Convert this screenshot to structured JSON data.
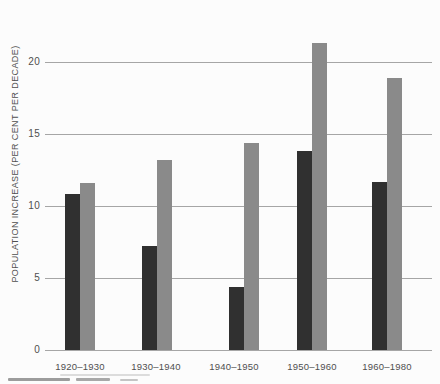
{
  "chart_data": {
    "type": "bar",
    "title": "",
    "ylabel": "POPULATION INCREASE (PER CENT PER DECADE)",
    "xlabel": "",
    "categories": [
      "1920–1930",
      "1930–1940",
      "1940–1950",
      "1950–1960",
      "1960–1980"
    ],
    "series": [
      {
        "name": "dark",
        "color": "#303030",
        "values": [
          10.8,
          7.2,
          4.4,
          13.8,
          11.7
        ]
      },
      {
        "name": "gray",
        "color": "#8a8a8a",
        "values": [
          11.6,
          13.2,
          14.4,
          21.3,
          18.9
        ]
      }
    ],
    "yticks": [
      0,
      5,
      10,
      15,
      20
    ],
    "ylim": [
      0,
      22
    ],
    "grid": true,
    "legend_position": "none"
  },
  "colors": {
    "background": "#fcfcfc",
    "gridline": "#979797",
    "text": "#4f4f4f"
  }
}
